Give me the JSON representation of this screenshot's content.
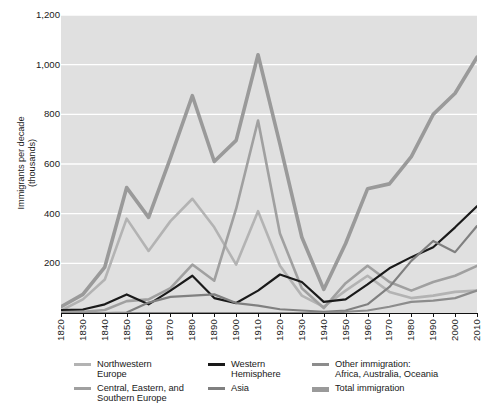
{
  "chart_data": {
    "type": "line",
    "title": "",
    "xlabel": "",
    "ylabel": "Immigrants per decade\n(thousands)",
    "xlim": [
      1820,
      2010
    ],
    "ylim": [
      0,
      1200
    ],
    "grid": true,
    "legend_position": "below-axis",
    "y_ticks": [
      0,
      200,
      400,
      600,
      800,
      1000,
      1200
    ],
    "y_tick_labels": [
      "",
      "200",
      "400",
      "600",
      "800",
      "1,000",
      "1,200"
    ],
    "x": [
      1820,
      1830,
      1840,
      1850,
      1860,
      1870,
      1880,
      1890,
      1900,
      1910,
      1920,
      1930,
      1940,
      1950,
      1960,
      1970,
      1980,
      1990,
      2000,
      2010
    ],
    "x_tick_labels": [
      "1820",
      "1830",
      "1840",
      "1850",
      "1860",
      "1870",
      "1880",
      "1890",
      "1900",
      "1910",
      "1920",
      "1930",
      "1940",
      "1950",
      "1960",
      "1970",
      "1980",
      "1990",
      "2000",
      "2010"
    ],
    "plot_background": "#e0e0e0",
    "gridline_color": "#ffffff",
    "series": [
      {
        "name": "Northwestern Europe",
        "color": "#b3b3b3",
        "width": 2.6,
        "values": [
          10,
          55,
          135,
          380,
          250,
          370,
          460,
          345,
          195,
          410,
          190,
          70,
          25,
          90,
          150,
          85,
          60,
          70,
          85,
          90
        ]
      },
      {
        "name": "Central, Eastern, and Southern Europe",
        "color": "#a0a0a0",
        "width": 2.6,
        "values": [
          3,
          5,
          12,
          48,
          55,
          100,
          195,
          130,
          420,
          775,
          320,
          100,
          20,
          120,
          190,
          125,
          90,
          125,
          150,
          190
        ]
      },
      {
        "name": "Western Hemisphere",
        "color": "#1a1a1a",
        "width": 2.2,
        "values": [
          12,
          14,
          35,
          75,
          35,
          90,
          150,
          60,
          40,
          90,
          155,
          125,
          45,
          55,
          115,
          180,
          225,
          265,
          345,
          430
        ]
      },
      {
        "name": "Asia",
        "color": "#808080",
        "width": 2.2,
        "values": [
          0,
          0,
          0,
          2,
          42,
          65,
          70,
          75,
          40,
          30,
          15,
          10,
          5,
          10,
          35,
          105,
          210,
          290,
          245,
          350
        ]
      },
      {
        "name": "Other immigration: Africa, Australia, Oceania",
        "color": "#8c8c8c",
        "width": 2.2,
        "values": [
          0,
          0,
          0,
          0,
          0,
          0,
          0,
          0,
          0,
          0,
          0,
          0,
          0,
          5,
          10,
          25,
          45,
          50,
          60,
          90
        ]
      },
      {
        "name": "Total immigration",
        "color": "#9a9a9a",
        "width": 3.6,
        "values": [
          25,
          75,
          185,
          505,
          385,
          625,
          875,
          610,
          695,
          1040,
          680,
          305,
          95,
          280,
          500,
          520,
          630,
          800,
          885,
          1030
        ]
      }
    ]
  },
  "legend": {
    "entries": [
      {
        "label": "Northwestern\nEurope",
        "name": "northwestern-europe",
        "color": "#b3b3b3",
        "thickness": 3,
        "left": 0,
        "top": 0
      },
      {
        "label": "Central, Eastern, and\nSouthern Europe",
        "name": "central-eastern-southern-europe",
        "color": "#a0a0a0",
        "thickness": 3,
        "left": 0,
        "top": 24
      },
      {
        "label": "Western\nHemisphere",
        "name": "western-hemisphere",
        "color": "#1a1a1a",
        "thickness": 3,
        "left": 134,
        "top": 0
      },
      {
        "label": "Asia",
        "name": "asia",
        "color": "#808080",
        "thickness": 3,
        "left": 134,
        "top": 24
      },
      {
        "label": "Other immigration:\nAfrica, Australia, Oceania",
        "name": "other-immigration",
        "color": "#8c8c8c",
        "thickness": 3,
        "left": 238,
        "top": 0
      },
      {
        "label": "Total immigration",
        "name": "total-immigration",
        "color": "#9a9a9a",
        "thickness": 5,
        "left": 238,
        "top": 24
      }
    ]
  }
}
